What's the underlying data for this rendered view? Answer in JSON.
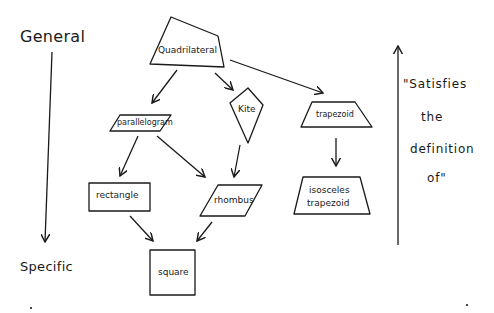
{
  "diagram": {
    "type": "hierarchy",
    "colors": {
      "stroke": "#1a1a1a",
      "background": "#ffffff"
    },
    "nodes": {
      "quadrilateral": {
        "label": "Quadrilateral",
        "shape": "irregular-quadrilateral"
      },
      "parallelogram": {
        "label": "parallelogram",
        "shape": "parallelogram"
      },
      "kite": {
        "label": "Kite",
        "shape": "kite"
      },
      "trapezoid": {
        "label": "trapezoid",
        "shape": "trapezoid"
      },
      "rectangle": {
        "label": "rectangle",
        "shape": "rectangle"
      },
      "rhombus": {
        "label": "rhombus",
        "shape": "rhombus"
      },
      "isosceles_trapezoid": {
        "label_line1": "isosceles",
        "label_line2": "trapezoid",
        "shape": "isosceles-trapezoid"
      },
      "square": {
        "label": "square",
        "shape": "square"
      }
    },
    "edges": [
      {
        "from": "Quadrilateral",
        "to": "parallelogram"
      },
      {
        "from": "Quadrilateral",
        "to": "Kite"
      },
      {
        "from": "Quadrilateral",
        "to": "trapezoid"
      },
      {
        "from": "parallelogram",
        "to": "rectangle"
      },
      {
        "from": "parallelogram",
        "to": "rhombus"
      },
      {
        "from": "Kite",
        "to": "rhombus"
      },
      {
        "from": "trapezoid",
        "to": "isosceles trapezoid"
      },
      {
        "from": "rectangle",
        "to": "square"
      },
      {
        "from": "rhombus",
        "to": "square"
      }
    ],
    "left_axis": {
      "top_label": "General",
      "bottom_label": "Specific",
      "direction": "down"
    },
    "right_axis": {
      "direction": "up",
      "note_lines": [
        "\"Satisfies",
        "the",
        "definition",
        "of\""
      ]
    }
  }
}
